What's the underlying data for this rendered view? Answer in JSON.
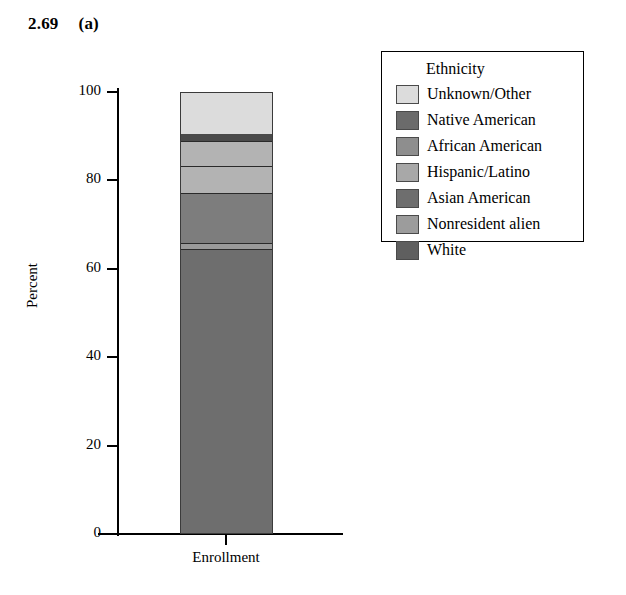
{
  "caption": {
    "number": "2.69",
    "part_label": "(a)"
  },
  "chart_data": {
    "type": "bar",
    "title": "",
    "subtitle": "",
    "xlabel": "",
    "ylabel": "Percent",
    "stacked": true,
    "grid": false,
    "legend_position": "right",
    "legend_title": "Ethnicity",
    "categories": [
      "Enrollment"
    ],
    "ylim": [
      0,
      100
    ],
    "yticks": [
      0,
      20,
      40,
      60,
      80,
      100
    ],
    "ytick_labels": [
      "0",
      "20",
      "40",
      "60",
      "80",
      "100"
    ],
    "xtick_labels": [
      "Enrollment"
    ],
    "series": [
      {
        "name": "White",
        "values": [
          64.5
        ],
        "color": "#6e6e6e",
        "cumulative_top": 64.5
      },
      {
        "name": "Nonresident alien",
        "values": [
          1.4
        ],
        "color": "#9a9a9a",
        "cumulative_top": 65.9
      },
      {
        "name": "Asian American",
        "values": [
          11.3
        ],
        "color": "#7d7d7d",
        "cumulative_top": 77.2
      },
      {
        "name": "Hispanic/Latino",
        "values": [
          6.0
        ],
        "color": "#b3b3b3",
        "cumulative_top": 83.2
      },
      {
        "name": "African American",
        "values": [
          5.8
        ],
        "color": "#b3b3b3",
        "cumulative_top": 89.0
      },
      {
        "name": "Native American",
        "values": [
          1.8
        ],
        "color": "#4a4a4a",
        "cumulative_top": 90.8
      },
      {
        "name": "Unknown/Other",
        "values": [
          9.2
        ],
        "color": "#dcdcdc",
        "cumulative_top": 100.0
      }
    ],
    "legend_entries": [
      {
        "label": "Unknown/Other",
        "color": "#dcdcdc"
      },
      {
        "label": "Native American",
        "color": "#6b6b6b"
      },
      {
        "label": "African American",
        "color": "#8e8e8e"
      },
      {
        "label": "Hispanic/Latino",
        "color": "#a8a8a8"
      },
      {
        "label": "Asian American",
        "color": "#6e6e6e"
      },
      {
        "label": "Nonresident alien",
        "color": "#9c9c9c"
      },
      {
        "label": "White",
        "color": "#5f5f5f"
      }
    ]
  }
}
